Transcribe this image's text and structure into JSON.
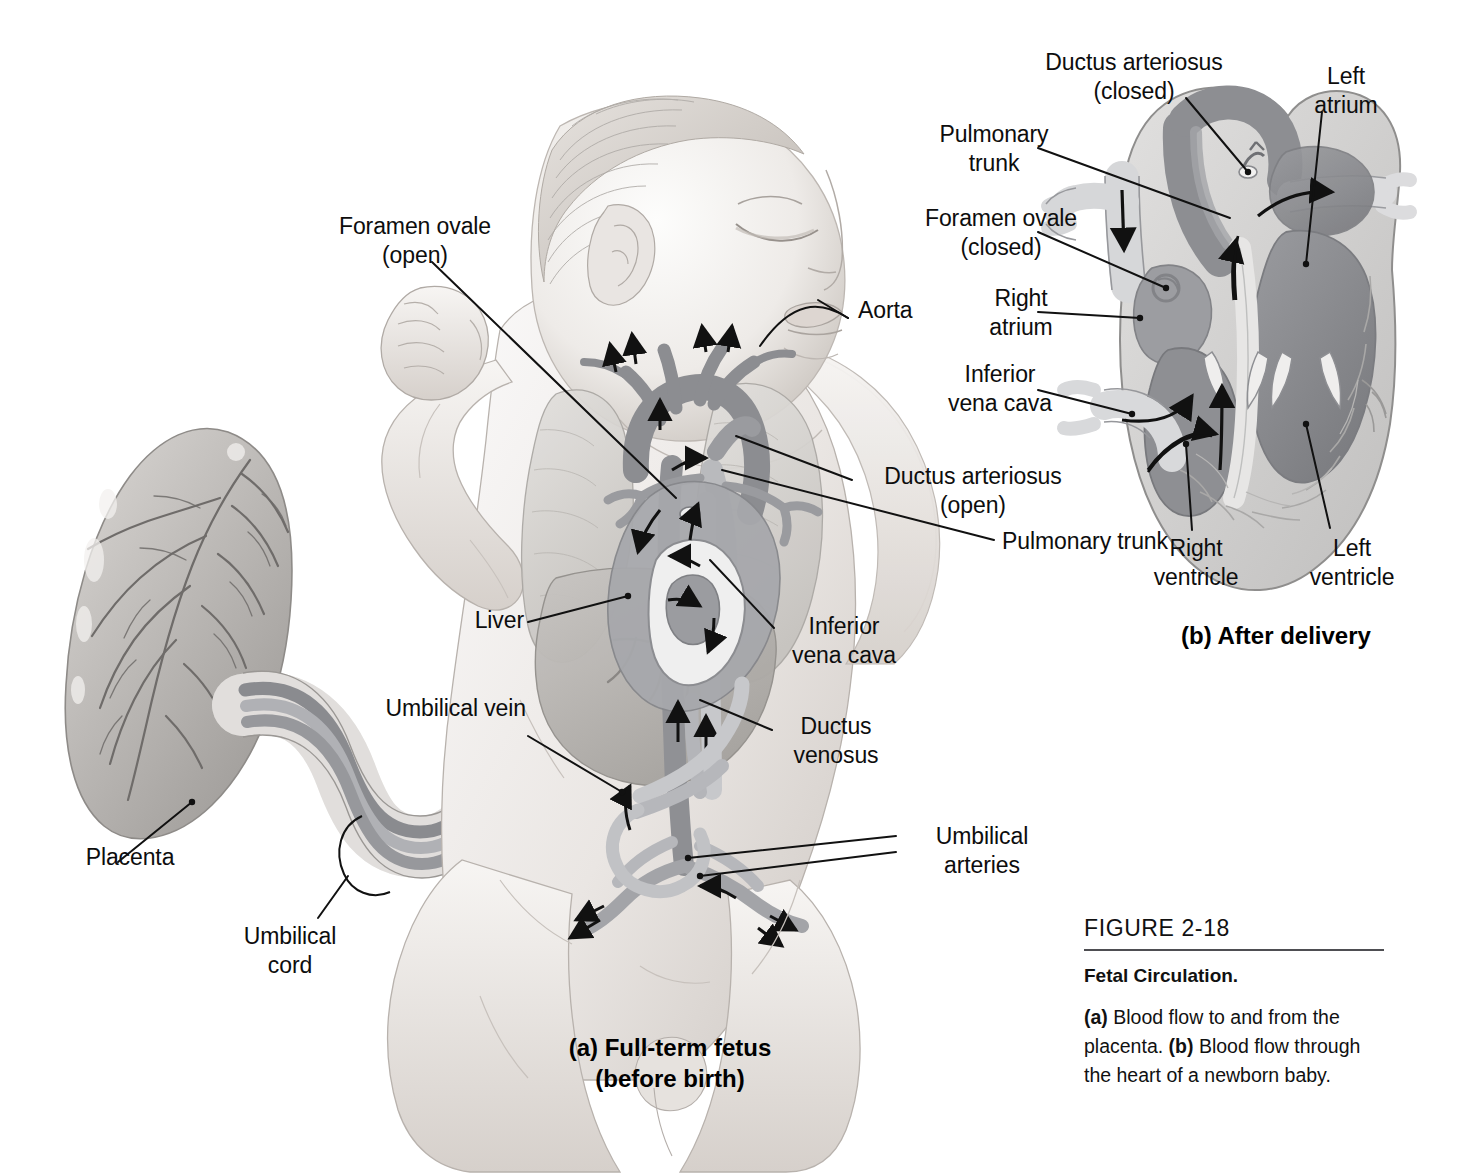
{
  "figure": {
    "number": "FIGURE 2-18",
    "title": "Fetal Circulation.",
    "body_a_marker": "(a)",
    "body_part1": " Blood flow to and from the placenta. ",
    "body_b_marker": "(b)",
    "body_part2": " Blood flow through the heart of a newborn baby."
  },
  "panel_a": {
    "caption_line1": "(a) Full-term fetus",
    "caption_line2": "(before birth)",
    "labels": {
      "foramen_ovale": "Foramen ovale\n(open)",
      "aorta": "Aorta",
      "ductus_arteriosus": "Ductus arteriosus\n(open)",
      "pulmonary_trunk": "Pulmonary trunk",
      "inferior_vena_cava": "Inferior\nvena cava",
      "ductus_venosus": "Ductus\nvenosus",
      "liver": "Liver",
      "umbilical_vein": "Umbilical vein",
      "umbilical_arteries": "Umbilical\narteries",
      "placenta": "Placenta",
      "umbilical_cord": "Umbilical\ncord"
    }
  },
  "panel_b": {
    "caption": "(b) After delivery",
    "labels": {
      "ductus_arteriosus": "Ductus arteriosus\n(closed)",
      "left_atrium": "Left\natrium",
      "pulmonary_trunk": "Pulmonary\ntrunk",
      "foramen_ovale": "Foramen ovale\n(closed)",
      "right_atrium": "Right\natrium",
      "inferior_vena_cava": "Inferior\nvena cava",
      "right_ventricle": "Right\nventricle",
      "left_ventricle": "Left\nventricle"
    }
  },
  "colors": {
    "background": "#ffffff",
    "leader_line": "#111111",
    "skin_light": "#f2f0ee",
    "skin_mid": "#ddd8d4",
    "skin_shadow": "#c3bdb8",
    "vessel_dark": "#8e8f93",
    "vessel_mid": "#a9aaae",
    "vessel_light": "#c9cacd",
    "vessel_pale": "#dcdcde",
    "chamber_dark": "#8b8c90",
    "myocardium": "#d3d2d1",
    "organ_mid": "#b7b5b2",
    "rule": "#4e4e52"
  }
}
